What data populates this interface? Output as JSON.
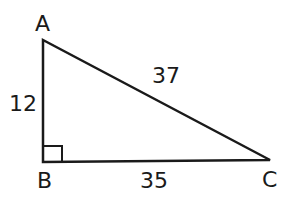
{
  "diagram": {
    "type": "right-triangle",
    "vertices": {
      "A": "A",
      "B": "B",
      "C": "C"
    },
    "sides": {
      "AB": "12",
      "AC": "37",
      "BC": "35"
    },
    "right_angle_at": "B",
    "stroke_color": "#1a1a1a"
  }
}
